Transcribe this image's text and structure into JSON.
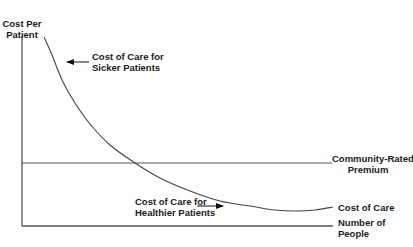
{
  "chart_data": {
    "type": "line",
    "title": "",
    "xlabel": "Number of People",
    "ylabel": "Cost Per Patient",
    "axes": {
      "x_ticks": [],
      "y_ticks": [],
      "grid": false
    },
    "series": [
      {
        "name": "Cost of Care",
        "description": "Decreasing convex curve: high cost for sicker patients, low cost for healthier patients",
        "points_px": [
          [
            44,
            37
          ],
          [
            52,
            55
          ],
          [
            62,
            80
          ],
          [
            75,
            103
          ],
          [
            90,
            124
          ],
          [
            110,
            145
          ],
          [
            135,
            163
          ],
          [
            160,
            178
          ],
          [
            190,
            191
          ],
          [
            220,
            201
          ],
          [
            250,
            206
          ],
          [
            275,
            210
          ],
          [
            295,
            211
          ],
          [
            315,
            210
          ],
          [
            333,
            207
          ]
        ]
      },
      {
        "name": "Community-Rated Premium",
        "description": "Constant horizontal line",
        "points_px": [
          [
            22,
            163
          ],
          [
            332,
            163
          ]
        ]
      }
    ],
    "annotations": [
      {
        "text": "Cost of Care for Sicker Patients",
        "arrow": "left",
        "points_to": "steep upper-left portion of cost curve"
      },
      {
        "text": "Cost of Care for Healthier Patients",
        "arrow": "right",
        "points_to": "flat lower-right portion of cost curve"
      }
    ]
  },
  "labels": {
    "y_axis": {
      "line1": "Cost Per",
      "line2": "Patient"
    },
    "x_axis": {
      "line1": "Number of",
      "line2": "People"
    },
    "sicker": {
      "line1": "Cost of Care for",
      "line2": "Sicker Patients"
    },
    "healthier": {
      "line1": "Cost of Care for",
      "line2": "Healthier Patients"
    },
    "premium": {
      "line1": "Community-Rated",
      "line2": "Premium"
    },
    "cost_curve": "Cost of Care"
  },
  "colors": {
    "axis": "#555555",
    "curve": "#444444",
    "premium_line": "#555555",
    "text": "#1a1a1a"
  }
}
